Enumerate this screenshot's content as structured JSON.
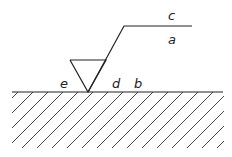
{
  "diagram": {
    "type": "surface-texture-symbol",
    "labels": {
      "a": "a",
      "b": "b",
      "c": "c",
      "d": "d",
      "e": "e"
    },
    "colors": {
      "stroke": "#222222",
      "background": "#ffffff"
    }
  }
}
